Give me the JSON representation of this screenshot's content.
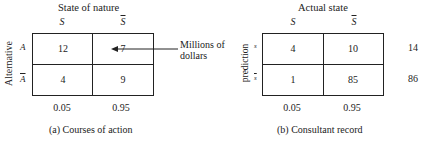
{
  "panel_a": {
    "title": "State of nature",
    "col_headers": [
      "S",
      "S"
    ],
    "col_header_overline": [
      false,
      true
    ],
    "row_axis_label": "Alternative",
    "row_labels": [
      "A",
      "A"
    ],
    "row_label_overline": [
      false,
      true
    ],
    "cells": [
      [
        "12",
        "7"
      ],
      [
        "4",
        "9"
      ]
    ],
    "annotation": {
      "line1": "Millions of",
      "line2": "dollars"
    },
    "col_probabilities": [
      "0.05",
      "0.95"
    ],
    "caption": "(a)  Courses of action"
  },
  "panel_b": {
    "title": "Actual state",
    "col_headers": [
      "S",
      "S"
    ],
    "col_header_overline": [
      false,
      true
    ],
    "row_axis_label": "prediction",
    "row_labels": [
      "s",
      "s"
    ],
    "row_label_overline": [
      false,
      true
    ],
    "cells": [
      [
        "4",
        "10"
      ],
      [
        "1",
        "85"
      ]
    ],
    "row_totals": [
      "14",
      "86"
    ],
    "col_probabilities": [
      "0.05",
      "0.95"
    ],
    "caption": "(b)  Consultant record"
  }
}
